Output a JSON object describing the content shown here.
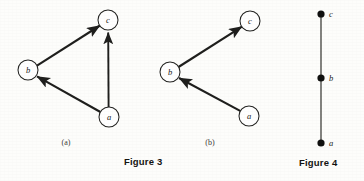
{
  "figures": [
    {
      "id": "figure-3",
      "caption": "Figure 3",
      "panels": [
        {
          "id": "panel-a",
          "label": "(a)",
          "label_x": 66,
          "label_y": 142,
          "type": "directed-graph",
          "nodes": [
            {
              "id": "c",
              "label": "c",
              "cx": 108,
              "cy": 20,
              "r": 10
            },
            {
              "id": "b",
              "label": "b",
              "cx": 28,
              "cy": 70,
              "r": 10
            },
            {
              "id": "a",
              "label": "a",
              "cx": 109,
              "cy": 117,
              "r": 10
            }
          ],
          "edges": [
            {
              "from": "b",
              "to": "c",
              "directed": true
            },
            {
              "from": "a",
              "to": "b",
              "directed": true
            },
            {
              "from": "a",
              "to": "c",
              "directed": true
            }
          ]
        },
        {
          "id": "panel-b",
          "label": "(b)",
          "label_x": 210,
          "label_y": 142,
          "type": "directed-graph",
          "nodes": [
            {
              "id": "c",
              "label": "c",
              "cx": 250,
              "cy": 21,
              "r": 10
            },
            {
              "id": "b",
              "label": "b",
              "cx": 170,
              "cy": 72,
              "r": 10
            },
            {
              "id": "a",
              "label": "a",
              "cx": 249,
              "cy": 116,
              "r": 10
            }
          ],
          "edges": [
            {
              "from": "b",
              "to": "c",
              "directed": true
            },
            {
              "from": "a",
              "to": "b",
              "directed": true
            }
          ]
        }
      ]
    },
    {
      "id": "figure-4",
      "caption": "Figure 4",
      "panels": [
        {
          "id": "panel-chain",
          "label": "",
          "type": "hasse-chain",
          "nodes": [
            {
              "id": "c",
              "label": "c",
              "cx": 321,
              "cy": 14,
              "r": 3.6
            },
            {
              "id": "b",
              "label": "b",
              "cx": 321,
              "cy": 78,
              "r": 3.6
            },
            {
              "id": "a",
              "label": "a",
              "cx": 321,
              "cy": 143,
              "r": 3.6
            }
          ],
          "edges": [
            {
              "from": "a",
              "to": "b",
              "directed": false
            },
            {
              "from": "b",
              "to": "c",
              "directed": false
            }
          ]
        }
      ]
    }
  ],
  "colors": {
    "ink": "#1a1a18",
    "line": "#2a2a28",
    "page": "#fdfdfb",
    "node_fill": "#ffffff"
  }
}
